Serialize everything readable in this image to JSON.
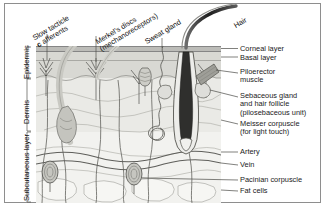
{
  "figure": {
    "border_color": "#8e8e8e",
    "background": "#ffffff"
  },
  "layer_brackets": [
    {
      "name": "epidermis",
      "label": "Epidermis"
    },
    {
      "name": "dermis",
      "label": "Dermis"
    },
    {
      "name": "subcutaneous",
      "label": "Subcutaneous layer"
    }
  ],
  "callouts": [
    {
      "name": "slow-tactile-afferents",
      "line1": "Slow tacticle",
      "line2_bold": "c",
      "line2": " afferents"
    },
    {
      "name": "merkels-discs",
      "line1": "Merkel's discs",
      "line2": "(mechanoreceptors)"
    },
    {
      "name": "sweat-gland",
      "line1": "Sweat gland"
    },
    {
      "name": "hair",
      "line1": "Hair"
    }
  ],
  "right_labels": [
    {
      "name": "corneal-layer",
      "text": "Corneal layer"
    },
    {
      "name": "basal-layer",
      "text": "Basal layer"
    },
    {
      "name": "piloerector-muscle",
      "text": "Piloerector\nmuscle"
    },
    {
      "name": "sebaceous-gland",
      "text": "Sebaceous gland\nand hair follicle\n(pilosebaceous unit)"
    },
    {
      "name": "meissner-corpuscle",
      "text": "Meisser corpuscle\n(for light touch)"
    },
    {
      "name": "artery",
      "text": "Artery"
    },
    {
      "name": "vein",
      "text": "Vein"
    },
    {
      "name": "pacinian-corpuscle",
      "text": "Pacinian corpuscle"
    },
    {
      "name": "fat-cells",
      "text": "Fat cells"
    }
  ],
  "colors": {
    "corneal_layer": "#b9b9b9",
    "epidermis_fill": "#d6d6d2",
    "dermis_fill": "#e9e9e6",
    "subcutaneous_fill": "#f1f1ee",
    "nerve_gray": "#b4b4ae",
    "hair_dark": "#2b2b2b",
    "muscle": "#9a9a94",
    "outline": "#4a4a4a",
    "text": "#1a1a1a"
  }
}
